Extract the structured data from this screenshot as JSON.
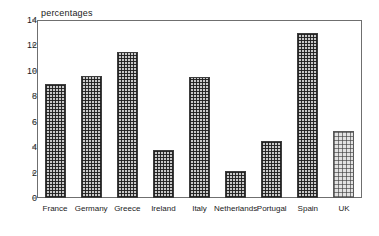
{
  "chart_data": {
    "type": "bar",
    "title": "",
    "ylabel": "percentages",
    "xlabel": "",
    "categories": [
      "France",
      "Germany",
      "Greece",
      "Ireland",
      "Italy",
      "Netherlands",
      "Portugal",
      "Spain",
      "UK"
    ],
    "values": [
      9.0,
      9.6,
      11.5,
      3.8,
      9.5,
      2.1,
      4.5,
      13.0,
      5.3
    ],
    "ylim": [
      0,
      14
    ],
    "yticks": [
      0,
      2,
      4,
      6,
      8,
      10,
      12,
      14
    ],
    "ytick_labels": [
      "0",
      "2",
      "4",
      "6",
      "8",
      "10",
      "12",
      "14"
    ],
    "grid": false,
    "legend": false,
    "series": [
      {
        "name": "percentages",
        "values": [
          9.0,
          9.6,
          11.5,
          3.8,
          9.5,
          2.1,
          4.5,
          13.0,
          5.3
        ]
      }
    ],
    "bar_styles": [
      "dark-crosshatch",
      "dark-crosshatch",
      "dark-crosshatch",
      "dark-crosshatch",
      "dark-crosshatch",
      "dark-crosshatch",
      "dark-crosshatch",
      "dark-crosshatch",
      "light-crosshatch"
    ],
    "colors": {
      "bar_fill_dark": "#c9c9c9",
      "bar_fill_light": "#e2e2e2",
      "bar_edge": "#3d3d3d",
      "axis": "#6f6f6f",
      "text": "#1a1a1a",
      "background": "#ffffff"
    }
  }
}
